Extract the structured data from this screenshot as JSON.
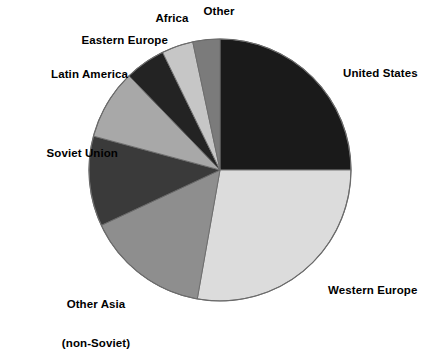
{
  "chart_data": {
    "type": "pie",
    "title": "",
    "subtitle": "",
    "xlabel": "",
    "ylabel": "",
    "legend_position": "none",
    "grid": false,
    "start_angle_deg": 0,
    "direction": "clockwise",
    "categories": [
      "United States",
      "Western Europe",
      "Other Asia (non-Soviet)",
      "Soviet Union",
      "Latin America",
      "Eastern Europe",
      "Africa",
      "Other"
    ],
    "values": [
      25,
      28,
      15,
      11,
      8.5,
      5,
      4,
      3.5
    ],
    "slices": [
      {
        "label": "United States",
        "label_line1": "United States",
        "label_line2": "",
        "value": 25,
        "start_deg": 0,
        "end_deg": 90,
        "color": "#1a1a1a"
      },
      {
        "label": "Western Europe",
        "label_line1": "Western Europe",
        "label_line2": "",
        "value": 28,
        "start_deg": 90,
        "end_deg": 190,
        "color": "#dcdcdc"
      },
      {
        "label": "Other Asia (non-Soviet)",
        "label_line1": "Other Asia",
        "label_line2": "(non-Soviet)",
        "value": 15,
        "start_deg": 190,
        "end_deg": 245,
        "color": "#8e8e8e"
      },
      {
        "label": "Soviet Union",
        "label_line1": "Soviet Union",
        "label_line2": "",
        "value": 11,
        "start_deg": 245,
        "end_deg": 285,
        "color": "#3a3a3a"
      },
      {
        "label": "Latin America",
        "label_line1": "Latin America",
        "label_line2": "",
        "value": 8.5,
        "start_deg": 285,
        "end_deg": 316,
        "color": "#a8a8a8"
      },
      {
        "label": "Eastern Europe",
        "label_line1": "Eastern Europe",
        "label_line2": "",
        "value": 5,
        "start_deg": 316,
        "end_deg": 334,
        "color": "#232323"
      },
      {
        "label": "Africa",
        "label_line1": "Africa",
        "label_line2": "",
        "value": 4,
        "start_deg": 334,
        "end_deg": 348,
        "color": "#c6c6c6"
      },
      {
        "label": "Other",
        "label_line1": "Other",
        "label_line2": "",
        "value": 3.5,
        "start_deg": 348,
        "end_deg": 360,
        "color": "#7b7b7b"
      }
    ],
    "geometry": {
      "center_x": 220,
      "center_y": 170,
      "radius": 131
    },
    "colors": {
      "background": "#ffffff",
      "outline": "#6b6b6b",
      "text": "#000000"
    }
  },
  "labels": {
    "united_states": "United States",
    "western_europe": "Western Europe",
    "other_asia_line1": "Other Asia",
    "other_asia_line2": "(non-Soviet)",
    "soviet_union": "Soviet Union",
    "latin_america": "Latin America",
    "eastern_europe": "Eastern Europe",
    "africa": "Africa",
    "other": "Other"
  }
}
